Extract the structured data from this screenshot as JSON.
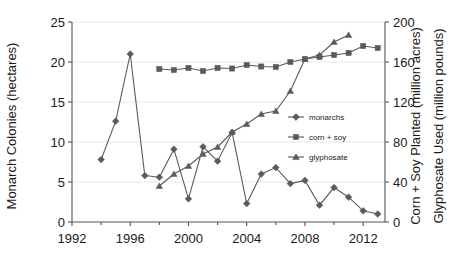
{
  "chart_data": {
    "type": "line",
    "title": "",
    "xlabel": "",
    "ylabel": "Monarch Colonies (hectares)",
    "y2label_1": "Corn + Soy Planted (million acres)",
    "y2label_2": "Glyphosate Used (million pounds)",
    "xlim": [
      1992,
      2013.5
    ],
    "ylim": [
      0,
      25
    ],
    "y2lim": [
      0,
      200
    ],
    "x_ticks": [
      1992,
      1996,
      2000,
      2004,
      2008,
      2012
    ],
    "x_tick_labels": [
      "1992",
      "1996",
      "2000",
      "2004",
      "2008",
      "2012"
    ],
    "x_minor_ticks": [
      1994,
      1998,
      2002,
      2006,
      2010
    ],
    "y_ticks": [
      0,
      5,
      10,
      15,
      20,
      25
    ],
    "y_tick_labels": [
      "0",
      "5",
      "10",
      "15",
      "20",
      "25"
    ],
    "y2_ticks": [
      0,
      40,
      80,
      120,
      160,
      200
    ],
    "y2_tick_labels": [
      "0",
      "40",
      "80",
      "120",
      "160",
      "200"
    ],
    "grid": true,
    "legend_position": "center-right",
    "series": [
      {
        "name": "monarchs",
        "marker": "diamond",
        "axis": "left",
        "x": [
          1994,
          1995,
          1996,
          1997,
          1998,
          1999,
          2000,
          2001,
          2002,
          2003,
          2004,
          2005,
          2006,
          2007,
          2008,
          2009,
          2010,
          2011,
          2012,
          2013
        ],
        "values": [
          7.8,
          12.6,
          21.0,
          5.8,
          5.6,
          9.1,
          2.9,
          9.4,
          7.6,
          11.2,
          2.3,
          6.0,
          6.8,
          4.8,
          5.2,
          2.1,
          4.3,
          3.1,
          1.4,
          1.0
        ]
      },
      {
        "name": "corn + soy",
        "marker": "square",
        "axis": "right",
        "x": [
          1998,
          1999,
          2000,
          2001,
          2002,
          2003,
          2004,
          2005,
          2006,
          2007,
          2008,
          2009,
          2010,
          2011,
          2012,
          2013
        ],
        "values": [
          153,
          152,
          154,
          151,
          154,
          153.5,
          157,
          155.5,
          155,
          160,
          163,
          165,
          167,
          169,
          176,
          174
        ]
      },
      {
        "name": "glyphosate",
        "marker": "triangle",
        "axis": "right",
        "x": [
          1998,
          1999,
          2000,
          2001,
          2002,
          2003,
          2004,
          2005,
          2006,
          2007,
          2008,
          2009,
          2010,
          2011
        ],
        "values": [
          36,
          48,
          56,
          68,
          75,
          90,
          98,
          108,
          111,
          131,
          163,
          167,
          180,
          187
        ]
      }
    ],
    "legend_entries": [
      {
        "label": "monarchs",
        "marker": "diamond"
      },
      {
        "label": "corn + soy",
        "marker": "square"
      },
      {
        "label": "glyphosate",
        "marker": "triangle"
      }
    ],
    "colors": {
      "series": "#5a5a5a",
      "axis": "#555555",
      "grid": "#e2e2e2",
      "background": "#ffffff",
      "text": "#1a1a1a"
    }
  }
}
